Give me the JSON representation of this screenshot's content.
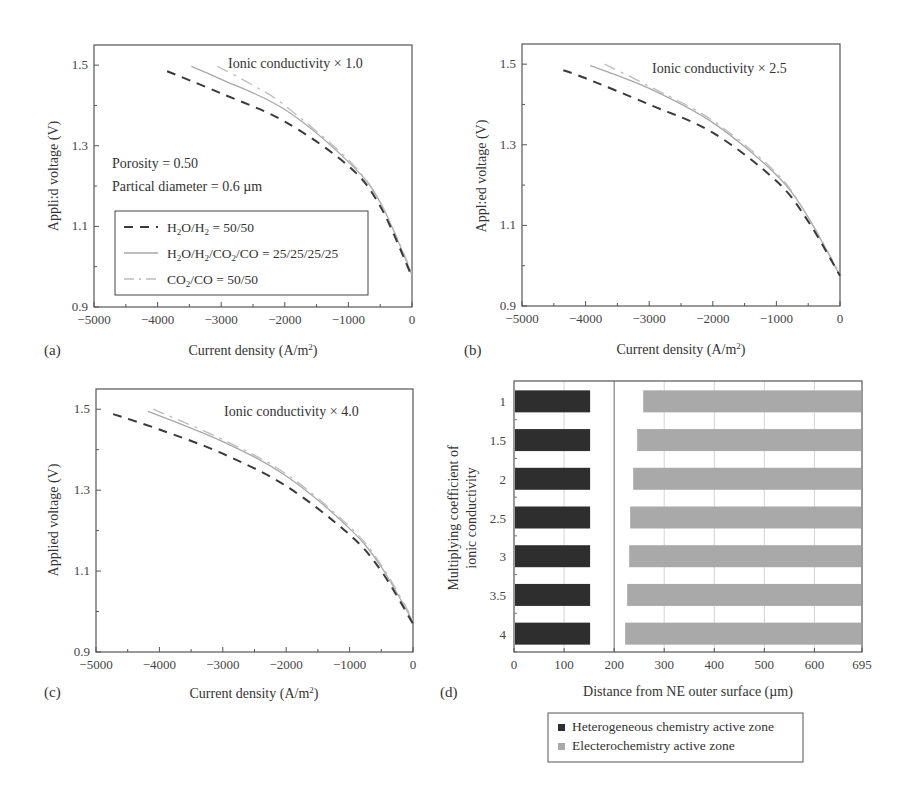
{
  "figure": {
    "panels": [
      "(a)",
      "(b)",
      "(c)",
      "(d)"
    ]
  },
  "chart_data": [
    {
      "id": "a",
      "type": "line",
      "panel_label": "(a)",
      "title": "",
      "annotation": "Ionic conductivity × 1.0",
      "extra_annotations": [
        "Porosity = 0.50",
        "Partical diameter = 0.6 µm"
      ],
      "xlabel": "Current density (A/m²)",
      "ylabel": "Applied voltage (V)",
      "ylabel_rendered": "Appli:d voltage (V)",
      "xlim": [
        -5000,
        0
      ],
      "ylim": [
        0.9,
        1.55
      ],
      "xticks": [
        -5000,
        -4000,
        -3000,
        -2000,
        -1000,
        0
      ],
      "yticks": [
        0.9,
        1.1,
        1.3,
        1.5
      ],
      "grid": false,
      "legend_position": "lower-left inside",
      "legend": [
        "H₂O/H₂ = 50/50",
        "H₂O/H₂/CO₂/CO = 25/25/25/25",
        "CO₂/CO = 50/50"
      ],
      "series": [
        {
          "name": "H₂O/H₂ = 50/50",
          "style": "dashed",
          "color": "#3a3a3a",
          "x": [
            -3850,
            -3000,
            -2000,
            -1000,
            -500,
            0
          ],
          "y": [
            1.485,
            1.43,
            1.36,
            1.25,
            1.15,
            0.975
          ]
        },
        {
          "name": "H₂O/H₂/CO₂/CO = 25/25/25/25",
          "style": "solid",
          "color": "#a8a8a8",
          "x": [
            -3470,
            -3000,
            -2000,
            -1000,
            -500,
            0
          ],
          "y": [
            1.497,
            1.465,
            1.39,
            1.26,
            1.16,
            0.98
          ]
        },
        {
          "name": "CO₂/CO = 50/50",
          "style": "dashdot",
          "color": "#bdbdbd",
          "x": [
            -3060,
            -2500,
            -2000,
            -1000,
            -500,
            0
          ],
          "y": [
            1.497,
            1.45,
            1.4,
            1.265,
            1.16,
            0.985
          ]
        }
      ]
    },
    {
      "id": "b",
      "type": "line",
      "panel_label": "(b)",
      "annotation": "Ionic conductivity × 2.5",
      "xlabel": "Current density (A/m²)",
      "ylabel": "Applied voltage (V)",
      "ylabel_rendered": "Appl:ed voltage (V)",
      "xlim": [
        -5000,
        0
      ],
      "ylim": [
        0.9,
        1.55
      ],
      "xticks": [
        -5000,
        -4000,
        -3000,
        -2000,
        -1000,
        0
      ],
      "yticks": [
        0.9,
        1.1,
        1.3,
        1.5
      ],
      "grid": false,
      "series": [
        {
          "name": "H₂O/H₂ = 50/50",
          "style": "dashed",
          "color": "#3a3a3a",
          "x": [
            -4350,
            -4000,
            -3000,
            -2000,
            -1000,
            -500,
            0
          ],
          "y": [
            1.485,
            1.465,
            1.4,
            1.33,
            1.21,
            1.11,
            0.975
          ]
        },
        {
          "name": "H₂O/H₂/CO₂/CO = 25/25/25/25",
          "style": "solid",
          "color": "#a8a8a8",
          "x": [
            -3930,
            -3000,
            -2000,
            -1000,
            -500,
            0
          ],
          "y": [
            1.497,
            1.44,
            1.355,
            1.225,
            1.12,
            0.975
          ]
        },
        {
          "name": "CO₂/CO = 50/50",
          "style": "dashdot",
          "color": "#bdbdbd",
          "x": [
            -3700,
            -3000,
            -2000,
            -1000,
            -500,
            0
          ],
          "y": [
            1.5,
            1.445,
            1.36,
            1.23,
            1.12,
            0.98
          ]
        }
      ]
    },
    {
      "id": "c",
      "type": "line",
      "panel_label": "(c)",
      "annotation": "Ionic conductivity × 4.0",
      "xlabel": "Current density (A/m²)",
      "ylabel": "Applied voltage (V)",
      "xlim": [
        -5000,
        0
      ],
      "ylim": [
        0.9,
        1.55
      ],
      "xticks": [
        -5000,
        -4000,
        -3000,
        -2000,
        -1000,
        0
      ],
      "yticks": [
        0.9,
        1.1,
        1.3,
        1.5
      ],
      "grid": false,
      "series": [
        {
          "name": "H₂O/H₂ = 50/50",
          "style": "dashed",
          "color": "#3a3a3a",
          "x": [
            -4730,
            -4000,
            -3000,
            -2000,
            -1000,
            -500,
            0
          ],
          "y": [
            1.488,
            1.45,
            1.39,
            1.31,
            1.19,
            1.1,
            0.97
          ]
        },
        {
          "name": "H₂O/H₂/CO₂/CO = 25/25/25/25",
          "style": "solid",
          "color": "#a8a8a8",
          "x": [
            -4180,
            -3000,
            -2000,
            -1000,
            -500,
            0
          ],
          "y": [
            1.495,
            1.42,
            1.335,
            1.205,
            1.11,
            0.975
          ]
        },
        {
          "name": "CO₂/CO = 50/50",
          "style": "dashdot",
          "color": "#bdbdbd",
          "x": [
            -4100,
            -3000,
            -2000,
            -1000,
            -500,
            0
          ],
          "y": [
            1.5,
            1.425,
            1.34,
            1.21,
            1.115,
            0.98
          ]
        }
      ]
    },
    {
      "id": "d",
      "type": "bar",
      "orientation": "horizontal",
      "panel_label": "(d)",
      "xlabel": "Distance from NE outer surface (µm)",
      "ylabel": "Multiplying coefficient of ionic conductivity",
      "ylabel_lines": [
        "Multiplying coefficient of",
        "ionic conductivity"
      ],
      "xlim": [
        0,
        695
      ],
      "xticks": [
        0,
        100,
        200,
        300,
        400,
        500,
        600,
        695
      ],
      "grid": true,
      "reference_line_x": 200,
      "categories": [
        "1",
        "1.5",
        "2",
        "2.5",
        "3",
        "3.5",
        "4"
      ],
      "legend_position": "below",
      "legend": [
        "Heterogeneous chemistry active zone",
        "Electerochemistry active zone"
      ],
      "series": [
        {
          "name": "Heterogeneous chemistry active zone",
          "color": "#2e2e2e",
          "start": [
            0,
            0,
            0,
            0,
            0,
            0,
            0
          ],
          "end": [
            152,
            152,
            152,
            152,
            152,
            152,
            152
          ]
        },
        {
          "name": "Electerochemistry active zone",
          "color": "#a9a9a9",
          "start": [
            258,
            246,
            238,
            232,
            230,
            226,
            222
          ],
          "end": [
            695,
            695,
            695,
            695,
            695,
            695,
            695
          ]
        }
      ]
    }
  ]
}
